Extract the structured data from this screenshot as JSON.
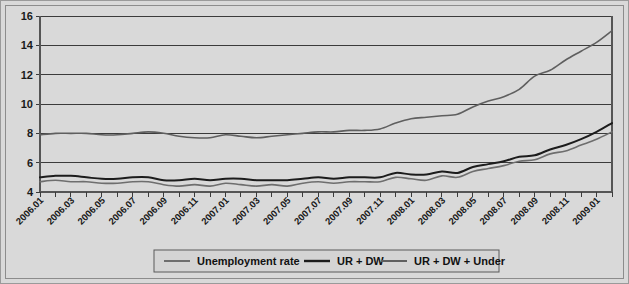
{
  "chart_data": {
    "type": "line",
    "title": "",
    "xlabel": "",
    "ylabel": "",
    "ylim": [
      4,
      16
    ],
    "yticks": [
      4,
      6,
      8,
      10,
      12,
      14,
      16
    ],
    "grid": true,
    "legend_position": "bottom",
    "x": [
      "2006.01",
      "2006.02",
      "2006.03",
      "2006.04",
      "2006.05",
      "2006.06",
      "2006.07",
      "2006.08",
      "2006.09",
      "2006.10",
      "2006.11",
      "2006.12",
      "2007.01",
      "2007.02",
      "2007.03",
      "2007.04",
      "2007.05",
      "2007.06",
      "2007.07",
      "2007.08",
      "2007.09",
      "2007.10",
      "2007.11",
      "2007.12",
      "2008.01",
      "2008.02",
      "2008.03",
      "2008.04",
      "2008.05",
      "2008.06",
      "2008.07",
      "2008.08",
      "2008.09",
      "2008.10",
      "2008.11",
      "2008.12",
      "2009.01",
      "2009.02"
    ],
    "xtick_labels": [
      "2006.01",
      "2006.03",
      "2006.05",
      "2006.07",
      "2006.09",
      "2006.11",
      "2007.01",
      "2007.03",
      "2007.05",
      "2007.07",
      "2007.09",
      "2007.11",
      "2008.01",
      "2008.03",
      "2008.05",
      "2008.07",
      "2008.09",
      "2008.11",
      "2009.01"
    ],
    "series": [
      {
        "name": "Unemployment rate",
        "color": "#6e6e6e",
        "width": 1.6,
        "values": [
          4.7,
          4.8,
          4.7,
          4.7,
          4.6,
          4.6,
          4.7,
          4.7,
          4.5,
          4.4,
          4.5,
          4.4,
          4.6,
          4.5,
          4.4,
          4.5,
          4.4,
          4.6,
          4.7,
          4.6,
          4.7,
          4.7,
          4.7,
          5.0,
          4.9,
          4.8,
          5.1,
          5.0,
          5.4,
          5.6,
          5.8,
          6.1,
          6.2,
          6.6,
          6.8,
          7.2,
          7.6,
          8.1
        ]
      },
      {
        "name": "UR + DW",
        "color": "#1c1c1c",
        "width": 2.0,
        "values": [
          5.0,
          5.1,
          5.1,
          5.0,
          4.9,
          4.9,
          5.0,
          5.0,
          4.8,
          4.8,
          4.9,
          4.8,
          4.9,
          4.9,
          4.8,
          4.8,
          4.8,
          4.9,
          5.0,
          4.9,
          5.0,
          5.0,
          5.0,
          5.3,
          5.2,
          5.2,
          5.4,
          5.3,
          5.7,
          5.9,
          6.1,
          6.4,
          6.5,
          6.9,
          7.2,
          7.6,
          8.1,
          8.7
        ]
      },
      {
        "name": "UR + DW + Under",
        "color": "#5f5f5f",
        "width": 1.6,
        "values": [
          7.9,
          8.0,
          8.0,
          8.0,
          7.9,
          7.9,
          8.0,
          8.1,
          8.0,
          7.8,
          7.7,
          7.7,
          7.9,
          7.8,
          7.7,
          7.8,
          7.9,
          8.0,
          8.1,
          8.1,
          8.2,
          8.2,
          8.3,
          8.7,
          9.0,
          9.1,
          9.2,
          9.3,
          9.8,
          10.2,
          10.5,
          11.0,
          11.9,
          12.3,
          13.0,
          13.6,
          14.2,
          15.0
        ]
      }
    ]
  },
  "legend": {
    "items": [
      {
        "label": "Unemployment rate"
      },
      {
        "label": "UR + DW"
      },
      {
        "label": "UR + DW + Under"
      }
    ]
  }
}
